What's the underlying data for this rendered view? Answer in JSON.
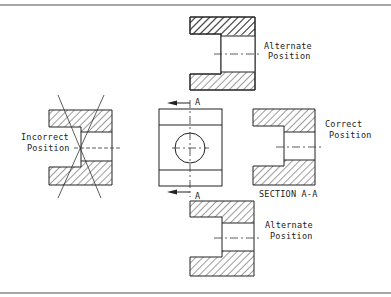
{
  "diagram": {
    "type": "technical-drawing",
    "colors": {
      "line": "#222222",
      "frame": "#888888",
      "background": "#ffffff"
    },
    "labels": {
      "incorrect": [
        "Incorrect",
        "Position"
      ],
      "correct": [
        "Correct",
        "Position"
      ],
      "alternate_top": [
        "Alternate",
        "Position"
      ],
      "alternate_bottom": [
        "Alternate",
        "Position"
      ],
      "section_title": "SECTION A-A",
      "cutting_plane_top": "A",
      "cutting_plane_bottom": "A"
    },
    "views": [
      {
        "name": "front-view",
        "position": "center"
      },
      {
        "name": "section-view-correct",
        "position": "right"
      },
      {
        "name": "section-view-incorrect",
        "position": "left",
        "crossed_out": true
      },
      {
        "name": "section-view-alternate-top",
        "position": "top"
      },
      {
        "name": "section-view-alternate-bottom",
        "position": "bottom"
      }
    ]
  }
}
